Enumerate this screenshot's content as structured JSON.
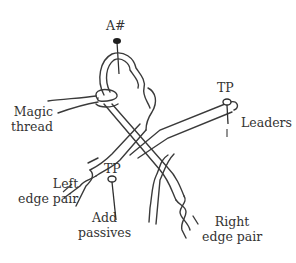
{
  "diagram": {
    "type": "bobbin-lace starting diagram",
    "labels": {
      "top_pin": "A#",
      "magic_thread": [
        "Magic",
        "thread"
      ],
      "tp_right": "TP",
      "leaders": "Leaders",
      "left_edge_pair": [
        "Left",
        "edge pair"
      ],
      "tp_bottom": "TP",
      "add_passives": [
        "Add",
        "passives"
      ],
      "right_edge_pair": [
        "Right",
        "edge pair"
      ]
    },
    "pins": [
      {
        "id": "A#",
        "style": "solid-head"
      },
      {
        "id": "TP-right",
        "style": "ring-head"
      },
      {
        "id": "TP-bottom",
        "style": "ring-head"
      }
    ],
    "colors": {
      "ink": "#3a3a3a",
      "text": "#333333",
      "background": "#ffffff"
    }
  }
}
